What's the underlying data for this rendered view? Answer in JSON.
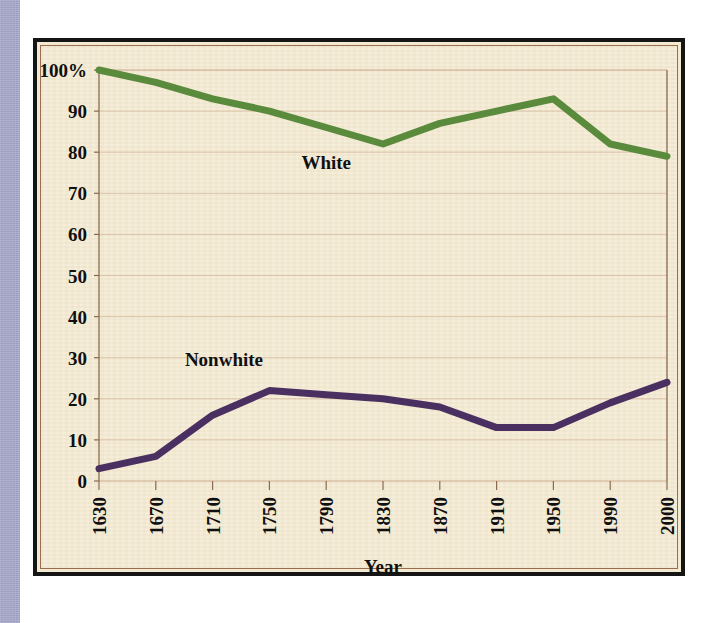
{
  "page": {
    "title_fragment": "",
    "background_color": "#ffffff",
    "strip_color": "#a8a8cc",
    "chart_panel_color": "#f5ecd6",
    "frame_color": "#151515",
    "inner_frame_color": "#9c6b52"
  },
  "chart_data": {
    "type": "line",
    "title": "",
    "xlabel": "Year",
    "ylabel": "",
    "grid": true,
    "legend": "inline-labels",
    "x": [
      1630,
      1670,
      1710,
      1750,
      1790,
      1830,
      1870,
      1910,
      1950,
      1990,
      2000
    ],
    "categories": [
      "1630",
      "1670",
      "1710",
      "1750",
      "1790",
      "1830",
      "1870",
      "1910",
      "1950",
      "1990",
      "2000"
    ],
    "ylim": [
      0,
      100
    ],
    "yticks": [
      0,
      10,
      20,
      30,
      40,
      50,
      60,
      70,
      80,
      90,
      100
    ],
    "ytick_labels": [
      "0",
      "10",
      "20",
      "30",
      "40",
      "50",
      "60",
      "70",
      "80",
      "90",
      "100%"
    ],
    "series": [
      {
        "name": "White",
        "color": "#5a8a3c",
        "label_x": 1790,
        "label_y": 76,
        "values": [
          100,
          97,
          93,
          90,
          86,
          82,
          87,
          90,
          93,
          82,
          79
        ]
      },
      {
        "name": "Nonwhite",
        "color": "#4a3060",
        "label_x": 1718,
        "label_y": 28,
        "values": [
          3,
          6,
          16,
          22,
          21,
          20,
          18,
          13,
          13,
          19,
          24
        ]
      }
    ]
  }
}
